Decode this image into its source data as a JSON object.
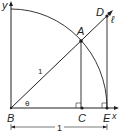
{
  "diagram": {
    "labels": {
      "y_axis": "y",
      "x_axis": "x",
      "point_A": "A",
      "point_B": "B",
      "point_C": "C",
      "point_D": "D",
      "point_E": "E",
      "line_l": "ℓ",
      "angle": "θ",
      "radius": "1",
      "base_length": "1"
    },
    "colors": {
      "stroke": "#231f20",
      "fill": "#231f20",
      "background": "#ffffff"
    }
  }
}
